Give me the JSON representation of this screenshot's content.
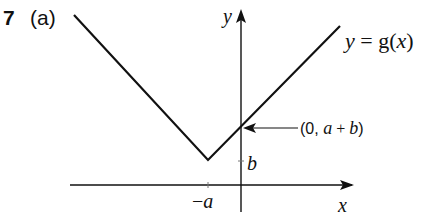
{
  "question": {
    "number": "7",
    "part": "(a)"
  },
  "diagram": {
    "type": "graph-sketch",
    "curve_label": {
      "y": "y",
      "eq": " = ",
      "g": "g",
      "paren_open": "(",
      "x": "x",
      "paren_close": ")"
    },
    "axis_labels": {
      "x": "x",
      "y": "y"
    },
    "x_tick_label": {
      "minus": "−",
      "var": "a"
    },
    "y_tick_label": "b",
    "annotation": {
      "prefix": "(0, ",
      "a": "a",
      "plus": " + ",
      "b": "b",
      "suffix": ")"
    },
    "colors": {
      "stroke": "#111111",
      "background": "#ffffff"
    }
  }
}
